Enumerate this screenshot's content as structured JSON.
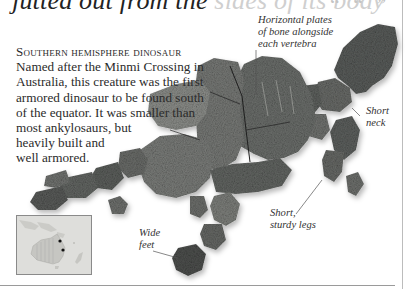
{
  "page": {
    "top_heading_visible": "jutted out from the",
    "top_heading_faded": " sides of its body"
  },
  "intro": {
    "title": "Southern hemisphere dinosaur",
    "lines": [
      "Named after the Minmi Crossing in",
      "Australia, this creature was the first",
      "armored dinosaur to be found south",
      "of the equator. It was smaller than",
      "most ankylosaurs, but",
      "heavily built and",
      "well armored."
    ]
  },
  "labels": {
    "plates": [
      "Horizontal plates",
      "of bone alongside",
      "each vertebra"
    ],
    "neck": [
      "Short",
      "neck"
    ],
    "legs": [
      "Short,",
      "sturdy legs"
    ],
    "feet": [
      "Wide",
      "feet"
    ]
  },
  "map": {
    "region": "Australia",
    "markers": 2,
    "marker_color": "#111111",
    "land_color": "#cfcfcc"
  },
  "colors": {
    "fossil_dark": "#4a4d4c",
    "fossil_mid": "#6f7270",
    "fossil_light": "#9a9c98",
    "text": "#2b2b2b",
    "rule": "#9a9a9a"
  }
}
